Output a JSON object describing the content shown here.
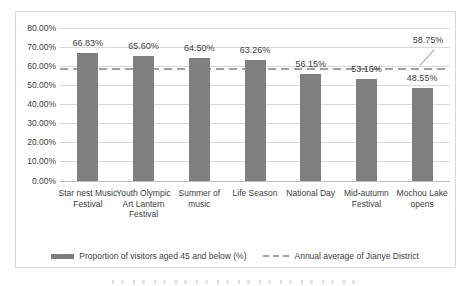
{
  "chart_data": {
    "type": "bar",
    "categories": [
      "Star nest Music Festival",
      "Youth Olympic Art Lantern Festival",
      "Summer of music",
      "Life Season",
      "National Day",
      "Mid-autumn Festival",
      "Mochou Lake opens"
    ],
    "values": [
      66.83,
      65.6,
      64.5,
      63.26,
      56.15,
      53.16,
      48.55
    ],
    "value_labels": [
      "66.83%",
      "65.60%",
      "64.50%",
      "63.26%",
      "56.15%",
      "53.16%",
      "48.55%"
    ],
    "average_line": {
      "value": 58.75,
      "label": "58.75%"
    },
    "ylim": [
      0,
      80
    ],
    "ytick_step": 10,
    "ytick_labels": [
      "0.00%",
      "10.00%",
      "20.00%",
      "30.00%",
      "40.00%",
      "50.00%",
      "60.00%",
      "70.00%",
      "80.00%"
    ],
    "grid": true,
    "legend_position": "bottom",
    "legend": [
      {
        "swatch": "bar",
        "label": "Proportion of visitors aged 45 and below (%)"
      },
      {
        "swatch": "dashed-line",
        "label": "Annual average of Jianye District"
      }
    ],
    "colors": {
      "bar": "#7f7f7f",
      "average_line": "#a0a0a0",
      "grid": "#d9d9d9",
      "axis": "#bfbfbf",
      "frame": "#d9d9d9",
      "text": "#404040"
    }
  }
}
